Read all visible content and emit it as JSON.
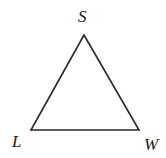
{
  "diagram": {
    "type": "triangle",
    "vertices": [
      {
        "name": "S",
        "label": "S",
        "x": 84,
        "y": 35
      },
      {
        "name": "L",
        "label": "L",
        "x": 31,
        "y": 130
      },
      {
        "name": "W",
        "label": "W",
        "x": 139,
        "y": 130
      }
    ],
    "edges": [
      {
        "from": "S",
        "to": "L"
      },
      {
        "from": "L",
        "to": "W"
      },
      {
        "from": "W",
        "to": "S"
      }
    ],
    "stroke_color": "#2a2a2a",
    "stroke_width": 1.6,
    "label_color": "#1a1a1a",
    "background": "#ffffff"
  }
}
